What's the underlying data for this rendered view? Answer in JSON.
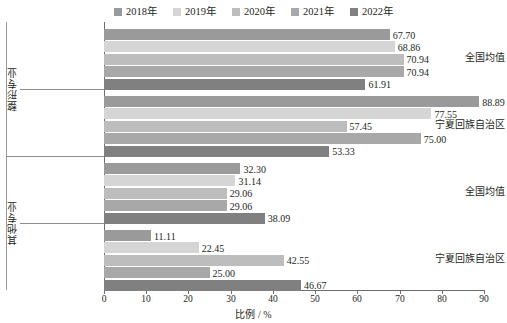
{
  "chart_data": {
    "type": "bar",
    "orientation": "horizontal",
    "title": "",
    "xlabel": "比例 / %",
    "ylabel": "",
    "xlim": [
      0,
      90
    ],
    "xticks": [
      0,
      10,
      20,
      30,
      40,
      50,
      60,
      70,
      80,
      90
    ],
    "grid": false,
    "legend_position": "top-center",
    "group_labels": [
      "整形专业",
      "其他专业"
    ],
    "categories": [
      "全国均值",
      "宁夏回族自治区",
      "全国均值",
      "宁夏回族自治区"
    ],
    "category_groups": [
      {
        "group": "整形专业",
        "categories": [
          "全国均值",
          "宁夏回族自治区"
        ]
      },
      {
        "group": "其他专业",
        "categories": [
          "全国均值",
          "宁夏回族自治区"
        ]
      }
    ],
    "series": [
      {
        "name": "2018年",
        "color": "#9a9a9a",
        "values": [
          67.7,
          88.89,
          32.3,
          11.11
        ]
      },
      {
        "name": "2019年",
        "color": "#d5d5d5",
        "values": [
          68.86,
          77.55,
          31.14,
          22.45
        ]
      },
      {
        "name": "2020年",
        "color": "#bdbdbd",
        "values": [
          70.94,
          57.45,
          29.06,
          42.55
        ]
      },
      {
        "name": "2021年",
        "color": "#a8a8a8",
        "values": [
          70.94,
          75.0,
          29.06,
          25.0
        ]
      },
      {
        "name": "2022年",
        "color": "#808080",
        "values": [
          61.91,
          53.33,
          38.09,
          46.67
        ]
      }
    ],
    "value_labels": [
      [
        "67.70",
        "68.86",
        "70.94",
        "70.94",
        "61.91"
      ],
      [
        "88.89",
        "77.55",
        "57.45",
        "75.00",
        "53.33"
      ],
      [
        "32.30",
        "31.14",
        "29.06",
        "29.06",
        "38.09"
      ],
      [
        "11.11",
        "22.45",
        "42.55",
        "25.00",
        "46.67"
      ]
    ]
  },
  "legend": {
    "items": [
      {
        "label": "2018年",
        "color": "#9a9a9a"
      },
      {
        "label": "2019年",
        "color": "#d5d5d5"
      },
      {
        "label": "2020年",
        "color": "#bdbdbd"
      },
      {
        "label": "2021年",
        "color": "#a8a8a8"
      },
      {
        "label": "2022年",
        "color": "#808080"
      }
    ]
  },
  "axis": {
    "x_title": "比例 / %",
    "x_tick_labels": [
      "0",
      "10",
      "20",
      "30",
      "40",
      "50",
      "60",
      "70",
      "80",
      "90"
    ]
  },
  "y_axis": {
    "groups": [
      {
        "label": "整形专业",
        "items": [
          "全国均值",
          "宁夏回族自治区"
        ]
      },
      {
        "label": "其他专业",
        "items": [
          "全国均值",
          "宁夏回族自治区"
        ]
      }
    ]
  }
}
